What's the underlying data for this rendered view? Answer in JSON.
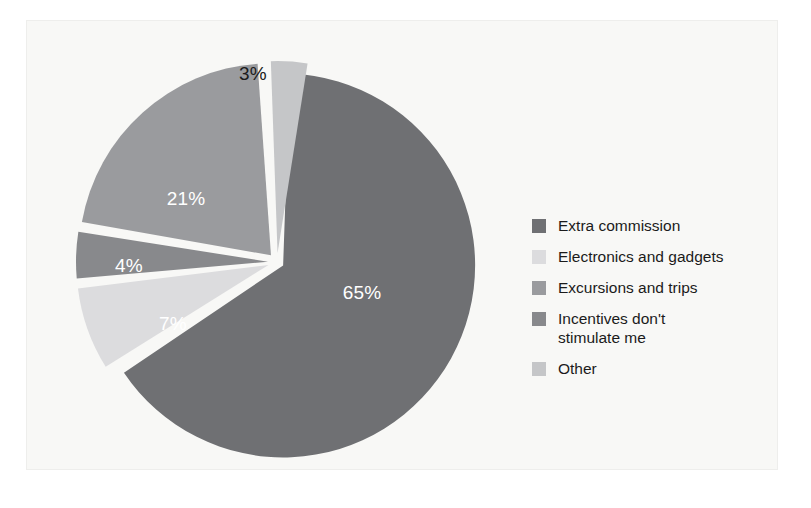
{
  "figure": {
    "background_color": "#f8f8f6",
    "page_color": "#ffffff",
    "border_color": "#eeeeec"
  },
  "legend": {
    "position": "right",
    "items": [
      {
        "label": "Extra commission",
        "color": "#6f7073",
        "swatch_name": "legend-swatch-extra-commission"
      },
      {
        "label": "Electronics and gadgets",
        "color": "#dcdcde",
        "swatch_name": "legend-swatch-electronics-and-gadgets"
      },
      {
        "label": "Excursions and trips",
        "color": "#9a9b9e",
        "swatch_name": "legend-swatch-excursions-and-trips"
      },
      {
        "label": "Incentives don't\nstimulate me",
        "color": "#88898c",
        "swatch_name": "legend-swatch-incentives-dont-stimulate-me"
      },
      {
        "label": "Other",
        "color": "#c5c6c8",
        "swatch_name": "legend-swatch-other"
      }
    ]
  },
  "chart_data": {
    "type": "pie",
    "title": "",
    "subtitle": "",
    "xlabel": "",
    "ylabel": "",
    "grid": false,
    "legend_position": "right",
    "units": "percent",
    "total": 100,
    "exploded": true,
    "start_angle_deg": -90,
    "direction": "clockwise",
    "categories": [
      "Extra commission",
      "Electronics and gadgets",
      "Excursions and trips",
      "Incentives don't stimulate me",
      "Other"
    ],
    "values": [
      65,
      7,
      21,
      4,
      3
    ],
    "labels": [
      "65%",
      "7%",
      "21%",
      "4%",
      "3%"
    ],
    "colors": [
      "#6f7073",
      "#dcdcde",
      "#9a9b9e",
      "#88898c",
      "#c5c6c8"
    ],
    "slices": [
      {
        "name": "Extra commission",
        "value": 65,
        "label": "65%",
        "color": "#6f7073",
        "label_color": "#ffffff",
        "label_inside": true,
        "start_deg": -88,
        "end_deg": 146,
        "explode": 7,
        "label_x": 362,
        "label_y": 299
      },
      {
        "name": "Electronics and gadgets",
        "value": 7,
        "label": "7%",
        "color": "#dcdcde",
        "label_color": "#1c1c1c",
        "label_inside": true,
        "start_deg": 148,
        "end_deg": 173,
        "explode": 9,
        "label_x": 173,
        "label_y": 330
      },
      {
        "name": "Excursions and trips",
        "value": 21,
        "label": "21%",
        "color": "#9a9b9e",
        "label_color": "#ffffff",
        "label_inside": true,
        "start_deg": 190,
        "end_deg": 266,
        "explode": 9,
        "label_x": 186,
        "label_y": 205
      },
      {
        "name": "Incentives don't stimulate me",
        "value": 4,
        "label": "4%",
        "color": "#88898c",
        "label_color": "#ffffff",
        "label_inside": true,
        "start_deg": 175,
        "end_deg": 189,
        "explode": 9,
        "label_x": 129,
        "label_y": 272
      },
      {
        "name": "Other",
        "value": 3,
        "label": "3%",
        "color": "#c5c6c8",
        "label_color": "#1c1c1c",
        "label_inside": false,
        "start_deg": 268,
        "end_deg": 279,
        "explode": 9,
        "label_x": 253,
        "label_y": 80
      }
    ],
    "geometry": {
      "center_x": 277,
      "center_y": 262,
      "radius": 192
    }
  }
}
